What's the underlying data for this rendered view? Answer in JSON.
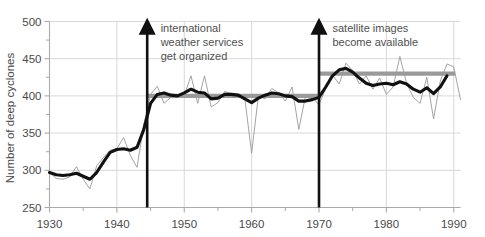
{
  "chart_data": {
    "type": "line",
    "title": "",
    "xlabel": "",
    "ylabel": "Number of deep cyclones",
    "xlim": [
      1930,
      1991
    ],
    "ylim": [
      250,
      500
    ],
    "xticks": [
      1930,
      1940,
      1950,
      1960,
      1970,
      1980,
      1990
    ],
    "xtick_labels": [
      "1930",
      "1940",
      "1950",
      "1960",
      "1970",
      "1980",
      "1990"
    ],
    "xminorticks": [
      1935,
      1945,
      1955,
      1965,
      1975,
      1985
    ],
    "yticks": [
      250,
      300,
      350,
      400,
      450,
      500
    ],
    "ytick_labels": [
      "250",
      "300",
      "350",
      "400",
      "450",
      "500"
    ],
    "yminorticks": [
      275,
      325,
      375,
      425,
      475
    ],
    "grid": true,
    "legend": "none",
    "series": [
      {
        "name": "annual-count",
        "style": "thin-gray",
        "color": "#9a9a9a",
        "x": [
          1930,
          1931,
          1932,
          1933,
          1934,
          1935,
          1936,
          1937,
          1938,
          1939,
          1940,
          1941,
          1942,
          1943,
          1944,
          1945,
          1946,
          1947,
          1948,
          1949,
          1950,
          1951,
          1952,
          1953,
          1954,
          1955,
          1956,
          1957,
          1958,
          1959,
          1960,
          1961,
          1962,
          1963,
          1964,
          1965,
          1966,
          1967,
          1968,
          1969,
          1970,
          1971,
          1972,
          1973,
          1974,
          1975,
          1976,
          1977,
          1978,
          1979,
          1980,
          1981,
          1982,
          1983,
          1984,
          1985,
          1986,
          1987,
          1988,
          1989,
          1990,
          1991
        ],
        "y": [
          297,
          289,
          288,
          291,
          305,
          288,
          275,
          306,
          317,
          327,
          329,
          344,
          320,
          304,
          362,
          402,
          413,
          390,
          398,
          400,
          400,
          427,
          390,
          427,
          385,
          391,
          406,
          403,
          400,
          396,
          323,
          400,
          396,
          410,
          404,
          393,
          412,
          355,
          400,
          398,
          388,
          410,
          428,
          416,
          444,
          434,
          416,
          427,
          409,
          424,
          402,
          412,
          453,
          417,
          398,
          390,
          425,
          369,
          420,
          443,
          439,
          395
        ]
      },
      {
        "name": "smoothed-trend",
        "style": "thick-black",
        "color": "#111111",
        "x": [
          1930,
          1931,
          1932,
          1933,
          1934,
          1935,
          1936,
          1937,
          1938,
          1939,
          1940,
          1941,
          1942,
          1943,
          1944,
          1945,
          1946,
          1947,
          1948,
          1949,
          1950,
          1951,
          1952,
          1953,
          1954,
          1955,
          1956,
          1957,
          1958,
          1959,
          1960,
          1961,
          1962,
          1963,
          1964,
          1965,
          1966,
          1967,
          1968,
          1969,
          1970,
          1971,
          1972,
          1973,
          1974,
          1975,
          1976,
          1977,
          1978,
          1979,
          1980,
          1981,
          1982,
          1983,
          1984,
          1985,
          1986,
          1987,
          1988,
          1989
        ],
        "y": [
          297,
          294,
          293,
          294,
          296,
          292,
          288,
          297,
          311,
          324,
          328,
          329,
          327,
          331,
          355,
          390,
          402,
          404,
          401,
          400,
          404,
          409,
          405,
          404,
          396,
          397,
          402,
          402,
          401,
          396,
          391,
          397,
          401,
          404,
          403,
          400,
          399,
          393,
          393,
          395,
          398,
          412,
          427,
          435,
          437,
          432,
          424,
          417,
          414,
          416,
          417,
          415,
          419,
          416,
          409,
          405,
          411,
          403,
          412,
          427
        ]
      }
    ],
    "mean_lines": [
      {
        "name": "mean-1945-1970",
        "x_start": 1944.5,
        "x_end": 1970.0,
        "y": 400,
        "color": "#9a9a9a"
      },
      {
        "name": "mean-1970-1990",
        "x_start": 1970.0,
        "x_end": 1990.2,
        "y": 430,
        "color": "#9a9a9a"
      }
    ],
    "annotations": [
      {
        "name": "international-weather-services",
        "arrow_x": 1944.5,
        "arrow_from_y": 250,
        "arrow_to_y": 505,
        "lines": [
          "international",
          "weather services",
          "get organized"
        ],
        "text_x": 1946.5,
        "text_top_y": 496
      },
      {
        "name": "satellite-images",
        "arrow_x": 1970.0,
        "arrow_from_y": 250,
        "arrow_to_y": 505,
        "lines": [
          "satellite images",
          "become available"
        ],
        "text_x": 1972.0,
        "text_top_y": 496
      }
    ],
    "colors": {
      "background": "#ffffff",
      "grid": "#d8d8d8",
      "axis": "#aaaaaa",
      "thin_line": "#9a9a9a",
      "thick_line": "#111111",
      "mean_line": "#9a9a9a",
      "arrow": "#101010",
      "text": "#4a4a4a"
    }
  },
  "axes": {
    "y_title": "Number of deep cyclones",
    "y_labels": [
      "500",
      "450",
      "400",
      "350",
      "300",
      "250"
    ],
    "x_labels": [
      "1930",
      "1940",
      "1950",
      "1960",
      "1970",
      "1980",
      "1990"
    ]
  },
  "annotation_text": {
    "left": {
      "line1": "international",
      "line2": "weather services",
      "line3": "get organized"
    },
    "right": {
      "line1": "satellite images",
      "line2": "become available"
    }
  }
}
